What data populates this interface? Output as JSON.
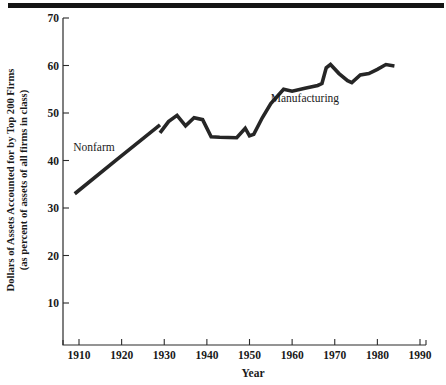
{
  "figure": {
    "top_rule": "decorative-rule"
  },
  "chart_data": {
    "type": "line",
    "title": "",
    "xlabel": "Year",
    "ylabel_line1": "Dollars of Assets Accounted for by Top 200 Firms",
    "ylabel_line2": "(as percent of assets of all firms in class)",
    "xlim": [
      1905,
      1992
    ],
    "ylim": [
      0,
      72
    ],
    "grid": false,
    "legend_position": "inline-annotation",
    "xticks": [
      1910,
      1920,
      1930,
      1940,
      1950,
      1960,
      1970,
      1980,
      1990
    ],
    "xtick_labels": [
      "1910",
      "1920",
      "1930",
      "1940",
      "1950",
      "1960",
      "1970",
      "1980",
      "1990"
    ],
    "yticks": [
      10,
      20,
      30,
      40,
      50,
      60,
      70
    ],
    "ytick_labels": [
      "10",
      "20",
      "30",
      "40",
      "50",
      "60",
      "70"
    ],
    "series": [
      {
        "name": "Nonfarm",
        "label_x": 1913.5,
        "label_y": 42.0,
        "color": "#262626",
        "x": [
          1909,
          1919,
          1929
        ],
        "values": [
          33.0,
          40.3,
          47.5
        ]
      },
      {
        "name": "Manufacturing",
        "label_x": 1963.0,
        "label_y": 52.3,
        "color": "#262626",
        "x": [
          1929,
          1931,
          1933,
          1935,
          1937,
          1939,
          1941,
          1943,
          1947,
          1949,
          1950,
          1951,
          1953,
          1955,
          1958,
          1960,
          1963,
          1966,
          1967,
          1968,
          1969,
          1971,
          1973,
          1974,
          1976,
          1978,
          1980,
          1982,
          1984
        ],
        "values": [
          45.8,
          48.2,
          49.5,
          47.3,
          49.0,
          48.6,
          45.0,
          44.9,
          44.8,
          46.8,
          45.2,
          45.5,
          49.0,
          52.0,
          55.0,
          54.6,
          55.2,
          55.8,
          56.2,
          59.5,
          60.2,
          58.3,
          56.8,
          56.4,
          58.0,
          58.3,
          59.2,
          60.2,
          59.9
        ]
      }
    ]
  }
}
